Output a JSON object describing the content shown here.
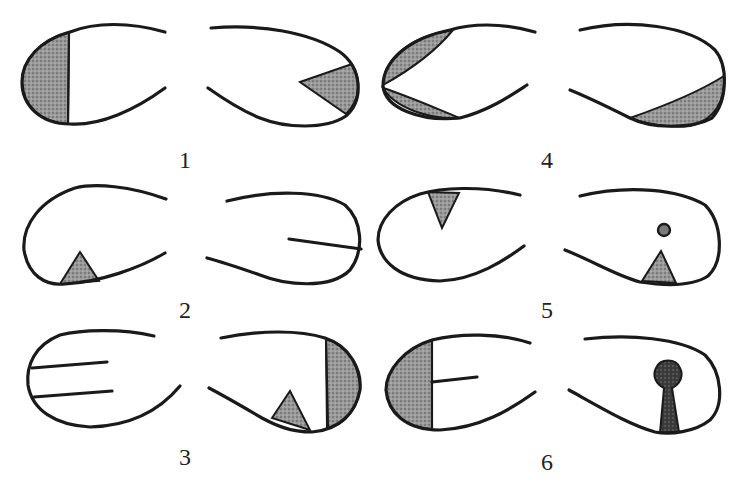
{
  "figure": {
    "colors": {
      "ink": "#1a1a1a",
      "shade": "#8c8c8c",
      "background": "#ffffff"
    },
    "panels": [
      {
        "id": 1,
        "label": "1",
        "left": "open oval with left segment shaded by vertical line",
        "right": "open oval with shaded triangle wedge at right end"
      },
      {
        "id": 2,
        "label": "2",
        "left": "open oval with small shaded triangle on bottom edge",
        "right": "open oval with horizontal line from right end inward"
      },
      {
        "id": 3,
        "label": "3",
        "left": "open oval with two horizontal lines from left end",
        "right": "open oval with shaded triangle on bottom and shaded right segment"
      },
      {
        "id": 4,
        "label": "4",
        "left": "open oval with two shaded lens wedges at left end (top and bottom)",
        "right": "open oval with shaded lens wedge along lower right"
      },
      {
        "id": 5,
        "label": "5",
        "left": "open oval with shaded triangle hanging from top edge",
        "right": "open oval with small circle and shaded triangle on bottom"
      },
      {
        "id": 6,
        "label": "6",
        "left": "open oval with shaded left segment and horizontal line from divider",
        "right": "open oval with dark keyhole shape on bottom"
      }
    ]
  }
}
